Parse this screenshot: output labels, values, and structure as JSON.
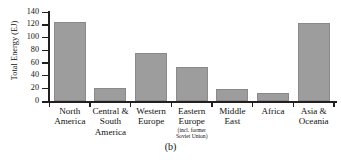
{
  "chart_data": {
    "type": "bar",
    "title": "",
    "caption": "(b)",
    "xlabel": "",
    "ylabel": "Total Energy (EJ)",
    "ylim": [
      0,
      140
    ],
    "yticks": [
      0,
      20,
      40,
      60,
      80,
      100,
      120,
      140
    ],
    "grid": false,
    "legend": null,
    "bar_color": "#9d9d9d",
    "axis_color": "#231f20",
    "categories": [
      "North America",
      "Central & South America",
      "Western Europe",
      "Eastern Europe (incl. former Soviet Union)",
      "Middle East",
      "Africa",
      "Asia & Oceania"
    ],
    "values": [
      124,
      21,
      75,
      53,
      19,
      13,
      122
    ],
    "category_labels": [
      {
        "line1": "North",
        "line2": "America",
        "line3": "",
        "sub": ""
      },
      {
        "line1": "Central &",
        "line2": "South",
        "line3": "America",
        "sub": ""
      },
      {
        "line1": "Western",
        "line2": "Europe",
        "line3": "",
        "sub": ""
      },
      {
        "line1": "Eastern",
        "line2": "Europe",
        "line3": "",
        "sub": "(incl. former Soviet Union)"
      },
      {
        "line1": "Middle",
        "line2": "East",
        "line3": "",
        "sub": ""
      },
      {
        "line1": "Africa",
        "line2": "",
        "line3": "",
        "sub": ""
      },
      {
        "line1": "Asia &",
        "line2": "Oceania",
        "line3": "",
        "sub": ""
      }
    ]
  }
}
